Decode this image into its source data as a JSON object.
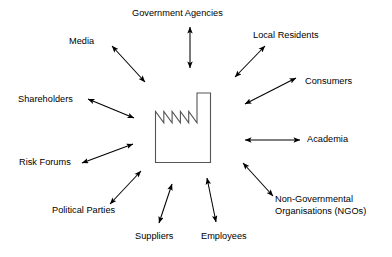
{
  "diagram": {
    "type": "hub-and-spoke",
    "center": {
      "name": "factory",
      "icon": "factory-icon",
      "label": ""
    },
    "colors": {
      "background": "#ffffff",
      "text": "#000000",
      "arrow": "#000000",
      "factory_stroke": "#555555"
    },
    "nodes": [
      {
        "id": "government-agencies",
        "label": "Government Agencies",
        "arrow": "double",
        "position": "top"
      },
      {
        "id": "local-residents",
        "label": "Local Residents",
        "arrow": "double",
        "position": "top-right"
      },
      {
        "id": "consumers",
        "label": "Consumers",
        "arrow": "double",
        "position": "right-upper"
      },
      {
        "id": "academia",
        "label": "Academia",
        "arrow": "double",
        "position": "right"
      },
      {
        "id": "ngos",
        "label": "Non-Governmental\nOrganisations (NGOs)",
        "arrow": "double",
        "position": "bottom-right"
      },
      {
        "id": "employees",
        "label": "Employees",
        "arrow": "double",
        "position": "bottom"
      },
      {
        "id": "suppliers",
        "label": "Suppliers",
        "arrow": "double",
        "position": "bottom"
      },
      {
        "id": "political-parties",
        "label": "Political Parties",
        "arrow": "double",
        "position": "bottom-left"
      },
      {
        "id": "risk-forums",
        "label": "Risk Forums",
        "arrow": "double",
        "position": "left-lower"
      },
      {
        "id": "shareholders",
        "label": "Shareholders",
        "arrow": "double",
        "position": "left"
      },
      {
        "id": "media",
        "label": "Media",
        "arrow": "double",
        "position": "top-left"
      }
    ]
  }
}
